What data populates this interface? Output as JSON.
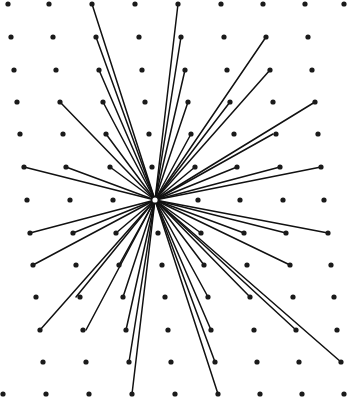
{
  "diagram": {
    "title": "Radial connections from central point on dot lattice",
    "width": 351,
    "height": 397,
    "background": "#ffffff",
    "dot_color": "#1a1a1a",
    "line_color": "#111111",
    "dot_radius": 2.6,
    "line_width": 1.5,
    "hub": {
      "x": 155,
      "y": 200,
      "r": 3.4,
      "stroke": "#111111",
      "fill": "#ffffff"
    },
    "rows": [
      {
        "y": 4,
        "xs": [
          8,
          49,
          92,
          135,
          178,
          221,
          263,
          305,
          344
        ]
      },
      {
        "y": 37,
        "xs": [
          11,
          53,
          96,
          139,
          181,
          224,
          266,
          308
        ]
      },
      {
        "y": 70,
        "xs": [
          14,
          56,
          99,
          142,
          185,
          227,
          270,
          312
        ]
      },
      {
        "y": 102,
        "xs": [
          17,
          60,
          103,
          145,
          188,
          230,
          273,
          315
        ]
      },
      {
        "y": 134,
        "xs": [
          20,
          63,
          106,
          149,
          191,
          234,
          276,
          318
        ]
      },
      {
        "y": 167,
        "xs": [
          24,
          66,
          110,
          152,
          195,
          237,
          280,
          321
        ]
      },
      {
        "y": 200,
        "xs": [
          27,
          70,
          113,
          198,
          240,
          283,
          324
        ]
      },
      {
        "y": 233,
        "xs": [
          30,
          73,
          116,
          158,
          201,
          244,
          286,
          328
        ]
      },
      {
        "y": 265,
        "xs": [
          33,
          76,
          119,
          162,
          204,
          247,
          290,
          331
        ]
      },
      {
        "y": 297,
        "xs": [
          36,
          80,
          123,
          165,
          208,
          250,
          293,
          334
        ]
      },
      {
        "y": 330,
        "xs": [
          40,
          83,
          126,
          168,
          211,
          254,
          296,
          337
        ]
      },
      {
        "y": 362,
        "xs": [
          43,
          86,
          129,
          171,
          215,
          257,
          299,
          341
        ]
      },
      {
        "y": 394,
        "xs": [
          3,
          46,
          89,
          132,
          175,
          218,
          260,
          302,
          344
        ]
      }
    ],
    "connections": [
      [
        92,
        4
      ],
      [
        96,
        37
      ],
      [
        99,
        70
      ],
      [
        60,
        102
      ],
      [
        103,
        102
      ],
      [
        106,
        134
      ],
      [
        24,
        167
      ],
      [
        66,
        167
      ],
      [
        110,
        167
      ],
      [
        178,
        4
      ],
      [
        181,
        37
      ],
      [
        185,
        70
      ],
      [
        188,
        102
      ],
      [
        191,
        134
      ],
      [
        195,
        167
      ],
      [
        266,
        37
      ],
      [
        270,
        70
      ],
      [
        230,
        102
      ],
      [
        315,
        102
      ],
      [
        273,
        134
      ],
      [
        237,
        167
      ],
      [
        280,
        167
      ],
      [
        321,
        167
      ],
      [
        30,
        233
      ],
      [
        73,
        233
      ],
      [
        116,
        233
      ],
      [
        33,
        265
      ],
      [
        119,
        265
      ],
      [
        76,
        297
      ],
      [
        123,
        297
      ],
      [
        40,
        330
      ],
      [
        86,
        330
      ],
      [
        126,
        330
      ],
      [
        129,
        362
      ],
      [
        132,
        394
      ],
      [
        201,
        233
      ],
      [
        244,
        233
      ],
      [
        286,
        233
      ],
      [
        328,
        233
      ],
      [
        204,
        265
      ],
      [
        290,
        265
      ],
      [
        208,
        297
      ],
      [
        250,
        297
      ],
      [
        211,
        330
      ],
      [
        296,
        330
      ],
      [
        215,
        362
      ],
      [
        341,
        362
      ],
      [
        218,
        394
      ]
    ]
  }
}
